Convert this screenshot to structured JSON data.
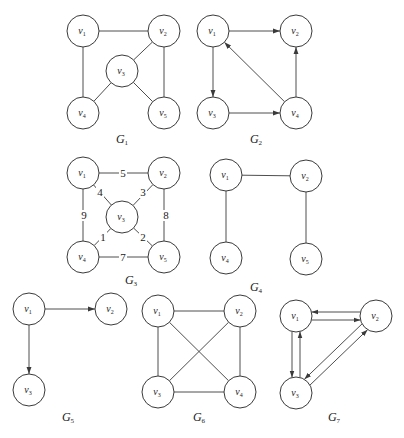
{
  "figure": {
    "width": 404,
    "height": 438,
    "node_radius": 16,
    "stroke_color": "#3a3a3a",
    "background": "#ffffff"
  },
  "graphs": [
    {
      "id": "G1",
      "name": "G",
      "sub": "1",
      "directed": false,
      "label_pos": [
        122,
        143
      ],
      "nodes": [
        {
          "id": "v1",
          "name": "v",
          "sub": "1",
          "x": 83,
          "y": 31
        },
        {
          "id": "v2",
          "name": "v",
          "sub": "2",
          "x": 164,
          "y": 31
        },
        {
          "id": "v3",
          "name": "v",
          "sub": "3",
          "x": 122,
          "y": 71
        },
        {
          "id": "v4",
          "name": "v",
          "sub": "4",
          "x": 83,
          "y": 113
        },
        {
          "id": "v5",
          "name": "v",
          "sub": "5",
          "x": 164,
          "y": 113
        }
      ],
      "edges": [
        {
          "from": "v1",
          "to": "v2"
        },
        {
          "from": "v1",
          "to": "v4"
        },
        {
          "from": "v2",
          "to": "v3"
        },
        {
          "from": "v2",
          "to": "v5"
        },
        {
          "from": "v3",
          "to": "v4"
        },
        {
          "from": "v3",
          "to": "v5"
        }
      ]
    },
    {
      "id": "G2",
      "name": "G",
      "sub": "2",
      "directed": true,
      "label_pos": [
        256,
        143
      ],
      "nodes": [
        {
          "id": "v1",
          "name": "v",
          "sub": "1",
          "x": 213,
          "y": 31
        },
        {
          "id": "v2",
          "name": "v",
          "sub": "2",
          "x": 296,
          "y": 31
        },
        {
          "id": "v3",
          "name": "v",
          "sub": "3",
          "x": 213,
          "y": 113
        },
        {
          "id": "v4",
          "name": "v",
          "sub": "4",
          "x": 296,
          "y": 113
        }
      ],
      "edges": [
        {
          "from": "v1",
          "to": "v2"
        },
        {
          "from": "v1",
          "to": "v3"
        },
        {
          "from": "v3",
          "to": "v4"
        },
        {
          "from": "v4",
          "to": "v1"
        },
        {
          "from": "v4",
          "to": "v2"
        }
      ]
    },
    {
      "id": "G3",
      "name": "G",
      "sub": "3",
      "directed": false,
      "weighted": true,
      "label_pos": [
        131,
        284
      ],
      "nodes": [
        {
          "id": "v1",
          "name": "v",
          "sub": "1",
          "x": 83,
          "y": 173
        },
        {
          "id": "v2",
          "name": "v",
          "sub": "2",
          "x": 164,
          "y": 173
        },
        {
          "id": "v3",
          "name": "v",
          "sub": "3",
          "x": 122,
          "y": 217
        },
        {
          "id": "v4",
          "name": "v",
          "sub": "4",
          "x": 83,
          "y": 257
        },
        {
          "id": "v5",
          "name": "v",
          "sub": "5",
          "x": 164,
          "y": 257
        }
      ],
      "edges": [
        {
          "from": "v1",
          "to": "v2",
          "weight": "5",
          "wpos": [
            123,
            177
          ]
        },
        {
          "from": "v1",
          "to": "v3",
          "weight": "4",
          "wpos": [
            100,
            196
          ]
        },
        {
          "from": "v1",
          "to": "v4",
          "weight": "9",
          "wpos": [
            84,
            219
          ]
        },
        {
          "from": "v2",
          "to": "v3",
          "weight": "3",
          "wpos": [
            143,
            196
          ]
        },
        {
          "from": "v2",
          "to": "v5",
          "weight": "8",
          "wpos": [
            166,
            219
          ]
        },
        {
          "from": "v3",
          "to": "v4",
          "weight": "1",
          "wpos": [
            103,
            241
          ]
        },
        {
          "from": "v3",
          "to": "v5",
          "weight": "2",
          "wpos": [
            143,
            241
          ]
        },
        {
          "from": "v4",
          "to": "v5",
          "weight": "7",
          "wpos": [
            123,
            261
          ]
        }
      ]
    },
    {
      "id": "G4",
      "name": "G",
      "sub": "4",
      "directed": false,
      "label_pos": [
        256,
        291
      ],
      "nodes": [
        {
          "id": "v1",
          "name": "v",
          "sub": "1",
          "x": 226,
          "y": 175
        },
        {
          "id": "v2",
          "name": "v",
          "sub": "2",
          "x": 306,
          "y": 176
        },
        {
          "id": "v4",
          "name": "v",
          "sub": "4",
          "x": 226,
          "y": 258
        },
        {
          "id": "v5",
          "name": "v",
          "sub": "5",
          "x": 306,
          "y": 259
        }
      ],
      "edges": [
        {
          "from": "v1",
          "to": "v2"
        },
        {
          "from": "v1",
          "to": "v4"
        },
        {
          "from": "v2",
          "to": "v5"
        }
      ]
    },
    {
      "id": "G5",
      "name": "G",
      "sub": "5",
      "directed": true,
      "label_pos": [
        68,
        421
      ],
      "nodes": [
        {
          "id": "v1",
          "name": "v",
          "sub": "1",
          "x": 29,
          "y": 309
        },
        {
          "id": "v2",
          "name": "v",
          "sub": "2",
          "x": 111,
          "y": 309
        },
        {
          "id": "v3",
          "name": "v",
          "sub": "3",
          "x": 29,
          "y": 390
        }
      ],
      "edges": [
        {
          "from": "v1",
          "to": "v2"
        },
        {
          "from": "v1",
          "to": "v3"
        }
      ]
    },
    {
      "id": "G6",
      "name": "G",
      "sub": "6",
      "directed": false,
      "label_pos": [
        199,
        421
      ],
      "nodes": [
        {
          "id": "v1",
          "name": "v",
          "sub": "1",
          "x": 158,
          "y": 311
        },
        {
          "id": "v2",
          "name": "v",
          "sub": "2",
          "x": 240,
          "y": 311
        },
        {
          "id": "v3",
          "name": "v",
          "sub": "3",
          "x": 158,
          "y": 392
        },
        {
          "id": "v4",
          "name": "v",
          "sub": "4",
          "x": 240,
          "y": 392
        }
      ],
      "edges": [
        {
          "from": "v1",
          "to": "v2"
        },
        {
          "from": "v1",
          "to": "v3"
        },
        {
          "from": "v1",
          "to": "v4"
        },
        {
          "from": "v2",
          "to": "v3"
        },
        {
          "from": "v2",
          "to": "v4"
        },
        {
          "from": "v3",
          "to": "v4"
        }
      ]
    },
    {
      "id": "G7",
      "name": "G",
      "sub": "7",
      "directed": true,
      "label_pos": [
        334,
        421
      ],
      "nodes": [
        {
          "id": "v1",
          "name": "v",
          "sub": "1",
          "x": 296,
          "y": 316
        },
        {
          "id": "v2",
          "name": "v",
          "sub": "2",
          "x": 376,
          "y": 316
        },
        {
          "id": "v3",
          "name": "v",
          "sub": "3",
          "x": 296,
          "y": 393
        }
      ],
      "edges": [
        {
          "from": "v1",
          "to": "v2",
          "offset": 4
        },
        {
          "from": "v2",
          "to": "v1",
          "offset": 4
        },
        {
          "from": "v1",
          "to": "v3",
          "offset": 4
        },
        {
          "from": "v3",
          "to": "v1",
          "offset": 4
        },
        {
          "from": "v2",
          "to": "v3",
          "offset": 4
        },
        {
          "from": "v3",
          "to": "v2",
          "offset": 4
        }
      ]
    }
  ]
}
